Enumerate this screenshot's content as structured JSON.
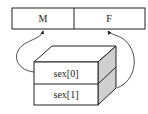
{
  "array": {
    "cells": [
      {
        "label": "M"
      },
      {
        "label": "F"
      }
    ]
  },
  "pointer_block": {
    "slots": [
      {
        "label": "sex[0]"
      },
      {
        "label": "sex[1]"
      }
    ],
    "side_color": "#cfcfcf",
    "stroke_color": "#222222"
  },
  "arrows": [
    {
      "from": "sex[0]",
      "to": "M"
    },
    {
      "from": "sex[1]",
      "to": "F"
    }
  ]
}
